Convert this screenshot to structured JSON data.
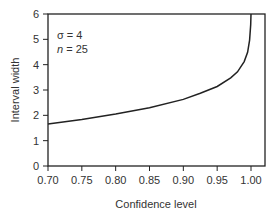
{
  "chart_data": {
    "type": "line",
    "title": "",
    "xlabel": "Confidence level",
    "ylabel": "Interval width",
    "xlim": [
      0.7,
      1.02
    ],
    "ylim": [
      0,
      6
    ],
    "xticks": [
      "0.70",
      "0.75",
      "0.80",
      "0.85",
      "0.90",
      "0.95",
      "1.00"
    ],
    "yticks": [
      "0",
      "1",
      "2",
      "3",
      "4",
      "5",
      "6"
    ],
    "annotations": [
      "σ = 4",
      "n = 25"
    ],
    "series": [
      {
        "name": "Interval width",
        "x": [
          0.7,
          0.75,
          0.8,
          0.85,
          0.9,
          0.925,
          0.95,
          0.97,
          0.98,
          0.99,
          0.995,
          0.998,
          0.9995
        ],
        "y": [
          1.66,
          1.84,
          2.05,
          2.3,
          2.63,
          2.87,
          3.14,
          3.48,
          3.72,
          4.12,
          4.49,
          4.97,
          5.58
        ]
      }
    ]
  }
}
